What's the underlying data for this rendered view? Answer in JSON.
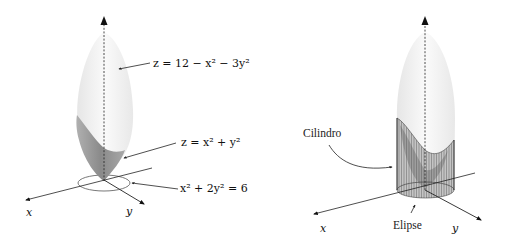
{
  "left_panel": {
    "axes": {
      "x_label": "x",
      "y_label": "y",
      "z_axis": "dashed vertical axis"
    },
    "annotations": [
      {
        "id": "upper-surface",
        "text": "z = 12 − x² − 3y²"
      },
      {
        "id": "lower-surface",
        "text": "z = x² + y²"
      },
      {
        "id": "base-ellipse",
        "text": "x² + 2y² = 6"
      }
    ]
  },
  "right_panel": {
    "axes": {
      "x_label": "x",
      "y_label": "y"
    },
    "annotations": [
      {
        "id": "cylinder",
        "text": "Cilindro"
      },
      {
        "id": "ellipse",
        "text": "Elipse"
      }
    ]
  },
  "colors": {
    "upper_surface": "#f2f2f2",
    "lower_surface": "#9a9a9a",
    "axis": "#222222",
    "cylinder_lines": "#555555"
  }
}
